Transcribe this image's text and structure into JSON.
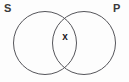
{
  "figure": {
    "type": "venn-diagram",
    "background_color": "#fdfdfd",
    "stroke_color": "#55555a",
    "labels": {
      "left_set": "S",
      "right_set": "P"
    },
    "marks": {
      "intersection": "x"
    },
    "geometry": {
      "left_circle": {
        "cx": 45,
        "cy": 43,
        "r": 31.5
      },
      "right_circle": {
        "cx": 84,
        "cy": 43,
        "r": 31.5
      },
      "stroke_width": 1
    }
  }
}
